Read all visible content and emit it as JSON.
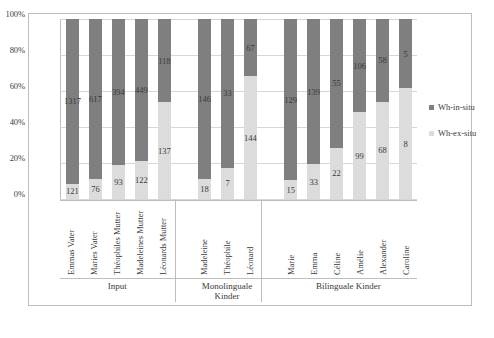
{
  "chart_data": {
    "type": "bar",
    "subtype": "stacked-100-percent",
    "title": "",
    "xlabel": "",
    "ylabel": "",
    "ylim": [
      0,
      100
    ],
    "ytick_labels": [
      "100%",
      "80%",
      "60%",
      "40%",
      "20%",
      "0%"
    ],
    "ytick_values": [
      100,
      80,
      60,
      40,
      20,
      0
    ],
    "grid": true,
    "legend_position": "right",
    "categories": [
      "Emmas Vater",
      "Maries Vater",
      "Théophiles Mutter",
      "Madeleines Mutter",
      "Léonards Mutter",
      "Madeleine",
      "Théophile",
      "Léonard",
      "Marie",
      "Emma",
      "Céline",
      "Amélie",
      "Alexander",
      "Caroline"
    ],
    "series": [
      {
        "name": "Wh-in-situ",
        "color": "#7f7f7f",
        "values": [
          1317,
          617,
          394,
          449,
          118,
          146,
          33,
          67,
          129,
          139,
          55,
          106,
          58,
          5
        ]
      },
      {
        "name": "Wh-ex-situ",
        "color": "#dcdcdc",
        "values": [
          121,
          76,
          93,
          122,
          137,
          18,
          7,
          144,
          15,
          33,
          22,
          99,
          68,
          8
        ]
      }
    ],
    "groups": [
      {
        "label": "Input",
        "count": 5
      },
      {
        "label": "Monolinguale Kinder",
        "count": 3
      },
      {
        "label": "Bilinguale Kinder",
        "count": 6
      }
    ]
  },
  "legend": {
    "items": [
      {
        "label": "Wh-in-situ",
        "color": "#7f7f7f"
      },
      {
        "label": "Wh-ex-situ",
        "color": "#dcdcdc"
      }
    ]
  },
  "axis": {
    "y_ticks": [
      "100%",
      "80%",
      "60%",
      "40%",
      "20%",
      "0%"
    ]
  },
  "groups": {
    "input": "Input",
    "monolingual_line1": "Monolinguale",
    "monolingual_line2": "Kinder",
    "bilingual": "Bilinguale Kinder"
  }
}
